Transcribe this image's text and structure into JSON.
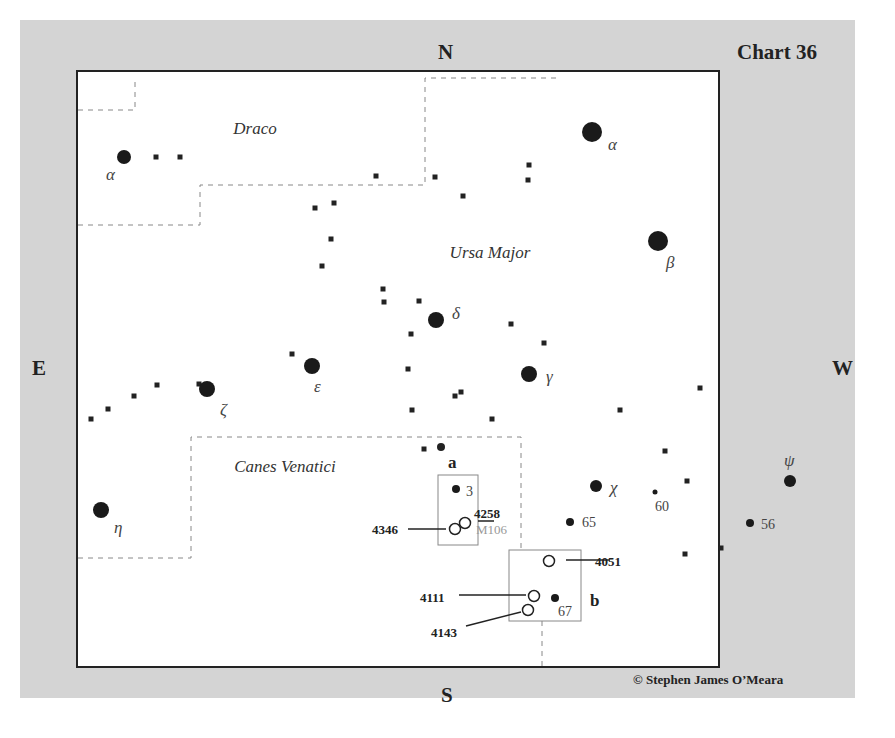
{
  "chart": {
    "title": "Chart 36",
    "copyright": "© Stephen James O’Meara",
    "directions": {
      "north": "N",
      "south": "S",
      "east": "E",
      "west": "W"
    },
    "constellations": [
      {
        "name": "Draco",
        "x": 255,
        "y": 134
      },
      {
        "name": "Ursa Major",
        "x": 490,
        "y": 258
      },
      {
        "name": "Canes Venatici",
        "x": 285,
        "y": 472
      }
    ],
    "bright_stars": [
      {
        "label": "α",
        "x": 124,
        "y": 157,
        "r": 7,
        "lx": 106,
        "ly": 180,
        "constellation": "Draco"
      },
      {
        "label": "α",
        "x": 592,
        "y": 132,
        "r": 10,
        "lx": 608,
        "ly": 150
      },
      {
        "label": "β",
        "x": 658,
        "y": 241,
        "r": 10,
        "lx": 666,
        "ly": 268
      },
      {
        "label": "δ",
        "x": 436,
        "y": 320,
        "r": 8,
        "lx": 452,
        "ly": 319
      },
      {
        "label": "γ",
        "x": 529,
        "y": 374,
        "r": 8,
        "lx": 546,
        "ly": 382
      },
      {
        "label": "ε",
        "x": 312,
        "y": 366,
        "r": 8,
        "lx": 314,
        "ly": 392
      },
      {
        "label": "ζ",
        "x": 207,
        "y": 389,
        "r": 8,
        "lx": 220,
        "ly": 415
      },
      {
        "label": "η",
        "x": 101,
        "y": 510,
        "r": 8,
        "lx": 114,
        "ly": 533
      },
      {
        "label": "χ",
        "x": 596,
        "y": 486,
        "r": 6,
        "lx": 610,
        "ly": 493
      },
      {
        "label": "ψ",
        "x": 790,
        "y": 481,
        "r": 6,
        "lx": 784,
        "ly": 466
      }
    ],
    "numbered_stars": [
      {
        "label": "3",
        "x": 456,
        "y": 489,
        "r": 4,
        "lx": 466,
        "ly": 496
      },
      {
        "label": "65",
        "x": 570,
        "y": 522,
        "r": 4,
        "lx": 582,
        "ly": 527
      },
      {
        "label": "60",
        "x": 655,
        "y": 492,
        "r": 2.5,
        "lx": 655,
        "ly": 511
      },
      {
        "label": "56",
        "x": 750,
        "y": 523,
        "r": 4,
        "lx": 761,
        "ly": 529
      },
      {
        "label": "67",
        "x": 555,
        "y": 598,
        "r": 4,
        "lx": 558,
        "ly": 616
      }
    ],
    "faint_stars": [
      [
        156,
        157
      ],
      [
        180,
        157
      ],
      [
        376,
        176
      ],
      [
        435,
        177
      ],
      [
        529,
        165
      ],
      [
        528,
        180
      ],
      [
        463,
        196
      ],
      [
        315,
        208
      ],
      [
        334,
        203
      ],
      [
        331,
        239
      ],
      [
        322,
        266
      ],
      [
        383,
        289
      ],
      [
        384,
        302
      ],
      [
        419,
        301
      ],
      [
        411,
        334
      ],
      [
        511,
        324
      ],
      [
        544,
        343
      ],
      [
        292,
        354
      ],
      [
        408,
        369
      ],
      [
        157,
        385
      ],
      [
        134,
        396
      ],
      [
        108,
        409
      ],
      [
        91,
        419
      ],
      [
        199,
        384
      ],
      [
        455,
        396
      ],
      [
        461,
        392
      ],
      [
        412,
        410
      ],
      [
        492,
        419
      ],
      [
        620,
        410
      ],
      [
        700,
        388
      ],
      [
        665,
        451
      ],
      [
        687,
        481
      ],
      [
        424,
        449
      ],
      [
        685,
        554
      ],
      [
        721,
        548
      ]
    ],
    "medium_stars": [
      [
        441,
        447
      ]
    ],
    "galaxies": [
      {
        "id": "4258",
        "alias": "M106",
        "x": 465,
        "y": 523,
        "label_x": 474,
        "label_y": 518
      },
      {
        "id": "4346",
        "x": 455,
        "y": 529,
        "label_x": 372,
        "label_y": 534
      },
      {
        "id": "4051",
        "x": 549,
        "y": 561,
        "label_x": 595,
        "label_y": 566
      },
      {
        "id": "4111",
        "x": 534,
        "y": 596,
        "label_x": 420,
        "label_y": 602
      },
      {
        "id": "4143",
        "x": 528,
        "y": 610,
        "label_x": 431,
        "label_y": 637
      }
    ],
    "finder_boxes": [
      {
        "label": "a",
        "x": 438,
        "y": 475,
        "w": 40,
        "h": 70,
        "label_x": 448,
        "label_y": 468
      },
      {
        "label": "b",
        "x": 509,
        "y": 550,
        "w": 72,
        "h": 71,
        "label_x": 590,
        "label_y": 606
      }
    ]
  }
}
